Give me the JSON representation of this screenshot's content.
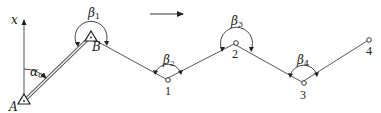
{
  "diagram": {
    "type": "traverse-survey",
    "direction_arrow": {
      "from": [
        150,
        14
      ],
      "to": [
        184,
        14
      ]
    },
    "axis": {
      "label": "x",
      "from": [
        24,
        101
      ],
      "to": [
        24,
        18
      ]
    },
    "points": [
      {
        "id": "A",
        "label": "A",
        "x": 24,
        "y": 101,
        "marker": "triangle"
      },
      {
        "id": "B",
        "label": "B",
        "x": 89,
        "y": 37,
        "marker": "triangle"
      },
      {
        "id": "1",
        "label": "1",
        "x": 168,
        "y": 80,
        "marker": "circle"
      },
      {
        "id": "2",
        "label": "2",
        "x": 236,
        "y": 43,
        "marker": "circle"
      },
      {
        "id": "3",
        "label": "3",
        "x": 304,
        "y": 83,
        "marker": "circle"
      },
      {
        "id": "4",
        "label": "4",
        "x": 369,
        "y": 40,
        "marker": "circle"
      }
    ],
    "known_edge": {
      "from": "A",
      "to": "B",
      "style": "double-line"
    },
    "edges": [
      [
        "B",
        "1"
      ],
      [
        "1",
        "2"
      ],
      [
        "2",
        "3"
      ],
      [
        "3",
        "4"
      ]
    ],
    "angles": [
      {
        "symbol": "α",
        "sub": "0",
        "at": "A"
      },
      {
        "symbol": "β",
        "sub": "1",
        "at": "B"
      },
      {
        "symbol": "β",
        "sub": "2",
        "at": "1"
      },
      {
        "symbol": "β",
        "sub": "3",
        "at": "2"
      },
      {
        "symbol": "β",
        "sub": "4",
        "at": "3"
      }
    ],
    "labels": {
      "axis": "x",
      "A": "A",
      "B": "B",
      "p1": "1",
      "p2": "2",
      "p3": "3",
      "p4": "4",
      "alpha0": "α",
      "alpha0_sub": "0",
      "beta1": "β",
      "beta1_sub": "1",
      "beta2": "β",
      "beta2_sub": "2",
      "beta3": "β",
      "beta3_sub": "3",
      "beta4": "β",
      "beta4_sub": "4"
    },
    "colors": {
      "line": "#333333",
      "background": "#ffffff"
    }
  }
}
